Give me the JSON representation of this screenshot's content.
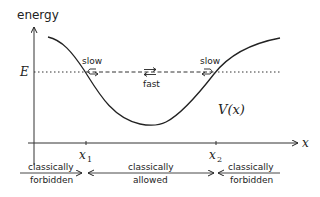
{
  "diagram": {
    "y_axis_label": "energy",
    "x_axis_label": "x",
    "energy_level_label": "E",
    "potential_label": "V(x)",
    "turning_points": [
      {
        "label": "x",
        "sub": "1"
      },
      {
        "label": "x",
        "sub": "2"
      }
    ],
    "speed_annotations": {
      "left": "slow",
      "middle": "fast",
      "right": "slow"
    },
    "regions": [
      {
        "line1": "classically",
        "line2": "forbidden"
      },
      {
        "line1": "classically",
        "line2": "allowed"
      },
      {
        "line1": "classically",
        "line2": "forbidden"
      }
    ],
    "colors": {
      "ink": "#222222",
      "background": "#ffffff"
    }
  }
}
